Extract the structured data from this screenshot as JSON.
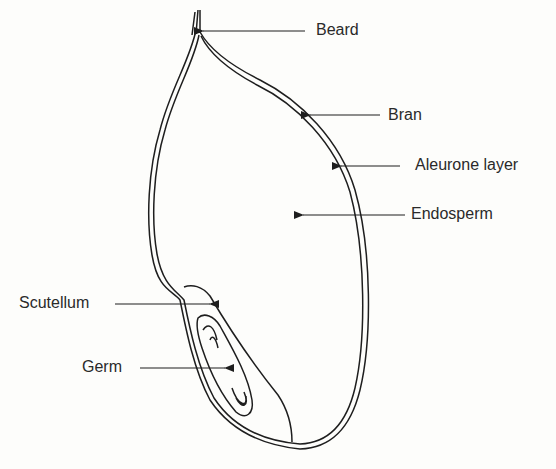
{
  "diagram": {
    "labels": [
      {
        "id": "beard",
        "text": "Beard"
      },
      {
        "id": "bran",
        "text": "Bran"
      },
      {
        "id": "aleurone",
        "text": "Aleurone layer"
      },
      {
        "id": "endosperm",
        "text": "Endosperm"
      },
      {
        "id": "scutellum",
        "text": "Scutellum"
      },
      {
        "id": "germ",
        "text": "Germ"
      }
    ],
    "colors": {
      "line": "#1e1e1e",
      "background": "#fdfdfb",
      "text": "#2a2a2a"
    }
  }
}
